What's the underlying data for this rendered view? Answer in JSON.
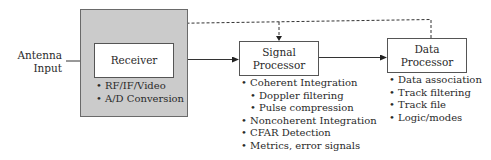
{
  "diagram": {
    "input_label": [
      "Antenna",
      "Input"
    ],
    "blocks": {
      "receiver": {
        "title": "Receiver",
        "items": [
          {
            "text": "RF/IF/Video",
            "level": 0
          },
          {
            "text": "A/D Conversion",
            "level": 0
          }
        ]
      },
      "signal_processor": {
        "title_lines": [
          "Signal",
          "Processor"
        ],
        "items": [
          {
            "text": "Coherent Integration",
            "level": 0
          },
          {
            "text": "Doppler filtering",
            "level": 1
          },
          {
            "text": "Pulse compression",
            "level": 1
          },
          {
            "text": "Noncoherent Integration",
            "level": 0
          },
          {
            "text": "CFAR Detection",
            "level": 0
          },
          {
            "text": "Metrics, error signals",
            "level": 0
          }
        ]
      },
      "data_processor": {
        "title_lines": [
          "Data",
          "Processor"
        ],
        "items": [
          {
            "text": "Data association",
            "level": 0
          },
          {
            "text": "Track filtering",
            "level": 0
          },
          {
            "text": "Track file",
            "level": 0
          },
          {
            "text": "Logic/modes",
            "level": 0
          }
        ]
      }
    },
    "connections": [
      {
        "from": "antenna-input",
        "to": "receiver",
        "style": "solid"
      },
      {
        "from": "receiver",
        "to": "signal_processor",
        "style": "solid"
      },
      {
        "from": "signal_processor",
        "to": "data_processor",
        "style": "solid"
      },
      {
        "from": "data_processor",
        "to": "receiver",
        "style": "dashed-feedback"
      },
      {
        "from": "data_processor",
        "to": "signal_processor",
        "style": "dashed-feedback"
      }
    ],
    "colors": {
      "receiver_group_fill": "#cbcbcb",
      "line": "#333333"
    }
  }
}
